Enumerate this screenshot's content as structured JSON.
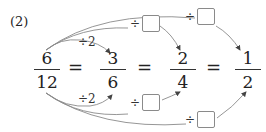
{
  "problem_label": "(2)",
  "fractions": [
    {
      "numerator": "6",
      "denominator": "12"
    },
    {
      "numerator": "3",
      "denominator": "6"
    },
    {
      "numerator": "2",
      "denominator": "4"
    },
    {
      "numerator": "1",
      "denominator": "2"
    }
  ],
  "equals": "=",
  "top_ops": [
    {
      "symbol": "÷",
      "value": "2"
    },
    {
      "symbol": "÷",
      "value": ""
    },
    {
      "symbol": "÷",
      "value": ""
    }
  ],
  "bottom_ops": [
    {
      "symbol": "÷",
      "value": "2"
    },
    {
      "symbol": "÷",
      "value": ""
    },
    {
      "symbol": "÷",
      "value": ""
    }
  ],
  "colors": {
    "text": "#222222",
    "arrow": "#777777",
    "box_border": "#8a8a8a"
  }
}
